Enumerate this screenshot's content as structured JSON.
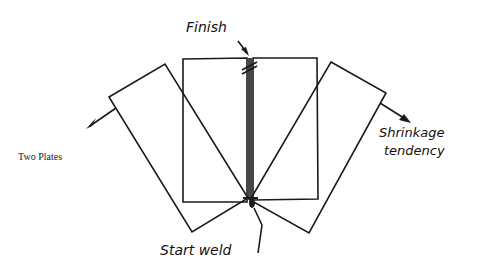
{
  "diagram": {
    "caption": "Two Plates",
    "labels": {
      "finish": "Finish",
      "shrinkage_line1": "Shrinkage",
      "shrinkage_line2": "tendency",
      "start": "Start weld"
    },
    "colors": {
      "stroke": "#1a1a1a",
      "background": "#ffffff"
    }
  }
}
